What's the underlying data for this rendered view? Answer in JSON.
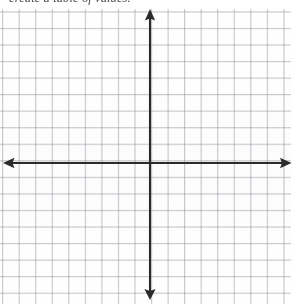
{
  "document": {
    "type": "math-worksheet-scan",
    "instruction": "create a table of values.",
    "page_width": 297,
    "page_height": 304,
    "background_color": "#ffffff"
  },
  "grid": {
    "name": "graph-paper",
    "cell_size_px": 16.55,
    "columns": 18,
    "rows": 18,
    "line_color": "#8c8e96",
    "minor_line_color": "#a5a8b0",
    "left": 0,
    "top": 9,
    "width": 292,
    "height": 295
  },
  "axes": {
    "name": "cartesian-axes",
    "color": "#2b2b2b",
    "stroke_width": 2,
    "origin": {
      "x": 150,
      "y": 163
    },
    "x_axis": {
      "x1": 4,
      "y1": 163,
      "x2": 291,
      "y2": 163
    },
    "y_axis": {
      "x1": 150,
      "y1": 10,
      "x2": 150,
      "y2": 299
    },
    "arrowheads": [
      {
        "label": "left-arrowhead",
        "direction": "left",
        "x": 4,
        "y": 163
      },
      {
        "label": "right-arrowhead",
        "direction": "right",
        "x": 291,
        "y": 163
      },
      {
        "label": "up-arrowhead",
        "direction": "up",
        "x": 150,
        "y": 10
      },
      {
        "label": "down-arrowhead",
        "direction": "down",
        "x": 150,
        "y": 299
      }
    ],
    "tick_labels": [],
    "axis_labels": {
      "x": "",
      "y": ""
    }
  }
}
